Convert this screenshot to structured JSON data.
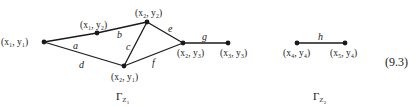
{
  "equation_number": "(9.3)",
  "graphs": [
    {
      "caption": "Γ",
      "caption_sub": "Z",
      "caption_subsub": "1",
      "nodes": [
        {
          "id": "x1y1",
          "label": "(x₁, y₁)",
          "x": 44,
          "y": 42
        },
        {
          "id": "x1y2",
          "label": "(x₁, y₂)",
          "x": 97,
          "y": 33
        },
        {
          "id": "x2y2",
          "label": "(x₂, y₂)",
          "x": 147,
          "y": 22
        },
        {
          "id": "x2y1",
          "label": "(x₂, y₁)",
          "x": 124,
          "y": 66
        },
        {
          "id": "x2y3",
          "label": "(x₂, y₃)",
          "x": 183,
          "y": 43
        },
        {
          "id": "x3y3",
          "label": "(x₃, y₃)",
          "x": 228,
          "y": 43
        }
      ],
      "edges": [
        {
          "label": "a",
          "from": "x1y1",
          "to": "x1y2"
        },
        {
          "label": "b",
          "from": "x1y2",
          "to": "x2y2"
        },
        {
          "label": "c",
          "from": "x2y2",
          "to": "x2y1"
        },
        {
          "label": "d",
          "from": "x1y1",
          "to": "x2y1"
        },
        {
          "label": "e",
          "from": "x2y2",
          "to": "x2y3"
        },
        {
          "label": "f",
          "from": "x2y1",
          "to": "x2y3"
        },
        {
          "label": "g",
          "from": "x2y3",
          "to": "x3y3"
        }
      ]
    },
    {
      "caption": "Γ",
      "caption_sub": "Z",
      "caption_subsub": "2",
      "nodes": [
        {
          "id": "x4y4",
          "label": "(x₄, y₄)",
          "x": 297,
          "y": 43
        },
        {
          "id": "x5y4",
          "label": "(x₅, y₄)",
          "x": 345,
          "y": 43
        }
      ],
      "edges": [
        {
          "label": "h",
          "from": "x4y4",
          "to": "x5y4"
        }
      ]
    }
  ]
}
